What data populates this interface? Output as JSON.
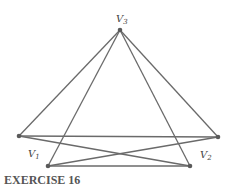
{
  "caption": "EXERCISE 16",
  "colors": {
    "edge": "#6a6a6a",
    "vertex": "#5a5a5a",
    "label": "#444444",
    "caption": "#555555"
  },
  "vertices": [
    {
      "id": "V3",
      "label": "V",
      "sub": "3",
      "x": 120,
      "y": 30,
      "lx": 116,
      "ly": 22
    },
    {
      "id": "V1",
      "label": "V",
      "sub": "1",
      "x": 19,
      "y": 136,
      "lx": 28,
      "ly": 157
    },
    {
      "id": "V2",
      "label": "V",
      "sub": "2",
      "x": 218,
      "y": 137,
      "lx": 200,
      "ly": 158
    },
    {
      "id": "B1",
      "label": "",
      "sub": "",
      "x": 48,
      "y": 166,
      "lx": 0,
      "ly": 0
    },
    {
      "id": "B2",
      "label": "",
      "sub": "",
      "x": 190,
      "y": 166,
      "lx": 0,
      "ly": 0
    }
  ],
  "edges": [
    [
      "V3",
      "V1"
    ],
    [
      "V3",
      "V2"
    ],
    [
      "V3",
      "B1"
    ],
    [
      "V3",
      "B2"
    ],
    [
      "V1",
      "V2"
    ],
    [
      "V1",
      "B2"
    ],
    [
      "V2",
      "B1"
    ],
    [
      "B1",
      "B2"
    ]
  ]
}
